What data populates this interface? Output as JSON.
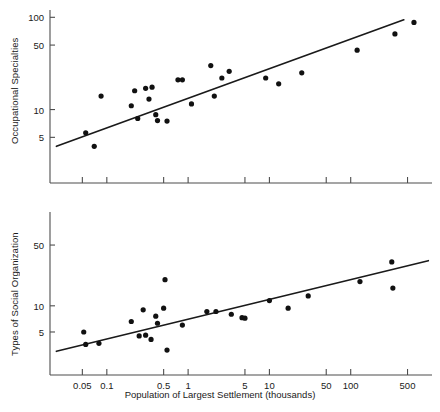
{
  "figure": {
    "xlabel": "Population of Largest Settlement (thousands)",
    "background": "#ffffff",
    "point_color": "#111111",
    "line_color": "#1a1a1a",
    "axis_color": "#4d4d4d"
  },
  "chart_data": [
    {
      "type": "scatter",
      "title": "",
      "xlabel": "",
      "ylabel": "Occupational Specialties",
      "xscale": "log",
      "yscale": "log",
      "xlim": [
        0.02,
        1000
      ],
      "ylim": [
        1.6,
        120
      ],
      "grid": false,
      "legend": null,
      "xticks": [
        0.05,
        0.1,
        0.5,
        1,
        5,
        10,
        50,
        100,
        500
      ],
      "xticklabels": [
        "",
        "",
        "",
        "",
        "",
        "",
        "",
        "",
        ""
      ],
      "yticks": [
        5,
        10,
        50,
        100
      ],
      "yticklabels": [
        "5",
        "10",
        "50",
        "100"
      ],
      "points": [
        {
          "x": 0.055,
          "y": 5.6
        },
        {
          "x": 0.07,
          "y": 4.0
        },
        {
          "x": 0.085,
          "y": 14.0
        },
        {
          "x": 0.2,
          "y": 11.0
        },
        {
          "x": 0.22,
          "y": 16.0
        },
        {
          "x": 0.24,
          "y": 8.0
        },
        {
          "x": 0.3,
          "y": 17.0
        },
        {
          "x": 0.33,
          "y": 13.0
        },
        {
          "x": 0.36,
          "y": 17.5
        },
        {
          "x": 0.4,
          "y": 8.8
        },
        {
          "x": 0.42,
          "y": 7.6
        },
        {
          "x": 0.55,
          "y": 7.5
        },
        {
          "x": 0.75,
          "y": 21.0
        },
        {
          "x": 0.85,
          "y": 21.0
        },
        {
          "x": 1.1,
          "y": 11.5
        },
        {
          "x": 1.9,
          "y": 30.0
        },
        {
          "x": 2.1,
          "y": 14.0
        },
        {
          "x": 2.6,
          "y": 22.0
        },
        {
          "x": 3.2,
          "y": 26.0
        },
        {
          "x": 9.0,
          "y": 22.0
        },
        {
          "x": 13.0,
          "y": 19.0
        },
        {
          "x": 25.0,
          "y": 25.0
        },
        {
          "x": 120.0,
          "y": 44.0
        },
        {
          "x": 350.0,
          "y": 66.0
        },
        {
          "x": 600.0,
          "y": 88.0
        }
      ],
      "fit_line": {
        "label": "regression line",
        "x_start": 0.024,
        "y_start": 4.0,
        "x_end": 450.0,
        "y_end": 94.0
      }
    },
    {
      "type": "scatter",
      "title": "",
      "xlabel": "Population of Largest Settlement (thousands)",
      "ylabel": "Types of Social Organization",
      "xscale": "log",
      "yscale": "log",
      "xlim": [
        0.02,
        1000
      ],
      "ylim": [
        1.6,
        120
      ],
      "grid": false,
      "legend": null,
      "xticks": [
        0.05,
        0.1,
        0.5,
        1,
        5,
        10,
        50,
        100,
        500
      ],
      "xticklabels": [
        "0.05",
        "0.1",
        "0.5",
        "1",
        "5",
        "10",
        "50",
        "100",
        "500"
      ],
      "yticks": [
        5,
        10,
        50
      ],
      "yticklabels": [
        "5",
        "10",
        "50"
      ],
      "points": [
        {
          "x": 0.052,
          "y": 5.0
        },
        {
          "x": 0.055,
          "y": 3.6
        },
        {
          "x": 0.08,
          "y": 3.7
        },
        {
          "x": 0.2,
          "y": 6.6
        },
        {
          "x": 0.25,
          "y": 4.5
        },
        {
          "x": 0.28,
          "y": 9.0
        },
        {
          "x": 0.3,
          "y": 4.6
        },
        {
          "x": 0.35,
          "y": 4.1
        },
        {
          "x": 0.4,
          "y": 7.6
        },
        {
          "x": 0.42,
          "y": 6.3
        },
        {
          "x": 0.5,
          "y": 9.4
        },
        {
          "x": 0.52,
          "y": 20.0
        },
        {
          "x": 0.55,
          "y": 3.1
        },
        {
          "x": 0.85,
          "y": 6.0
        },
        {
          "x": 1.7,
          "y": 8.6
        },
        {
          "x": 2.2,
          "y": 8.6
        },
        {
          "x": 3.4,
          "y": 8.0
        },
        {
          "x": 4.6,
          "y": 7.3
        },
        {
          "x": 5.0,
          "y": 7.2
        },
        {
          "x": 10.0,
          "y": 11.5
        },
        {
          "x": 17.0,
          "y": 9.4
        },
        {
          "x": 30.0,
          "y": 13.0
        },
        {
          "x": 130.0,
          "y": 19.0
        },
        {
          "x": 320.0,
          "y": 32.0
        },
        {
          "x": 330.0,
          "y": 16.0
        }
      ],
      "fit_line": {
        "label": "regression line",
        "x_start": 0.024,
        "y_start": 3.0,
        "x_end": 900.0,
        "y_end": 33.0
      }
    }
  ]
}
